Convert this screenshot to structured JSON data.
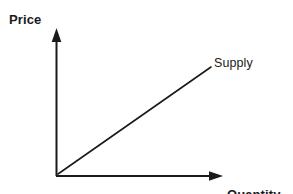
{
  "figure": {
    "kind": "economics-supply-curve-diagram",
    "background_color": "#ffffff",
    "ink_color": "#1a1a1a"
  },
  "labels": {
    "y_axis": "Price",
    "curve": "Supply",
    "x_axis_line1": "Quantity",
    "x_axis_line2": "supplied"
  },
  "chart_data": {
    "type": "line",
    "title": "",
    "subtitle": "",
    "xlabel": "Quantity supplied",
    "ylabel": "Price",
    "grid": false,
    "legend": "none",
    "annotations": [
      {
        "text": "Supply",
        "attached_to": "supply-line",
        "position": "upper-right-of-line-end"
      }
    ],
    "axes": {
      "x": {
        "label": "Quantity supplied",
        "ticks": [],
        "tick_labels": [],
        "arrow": true,
        "range_units": "unlabeled"
      },
      "y": {
        "label": "Price",
        "ticks": [],
        "tick_labels": [],
        "arrow": true,
        "range_units": "unlabeled"
      }
    },
    "series": [
      {
        "name": "Supply",
        "type": "line",
        "style": "straight-upward-sloping",
        "points": [
          {
            "x": 0,
            "y": 0
          },
          {
            "x": 1,
            "y": 1
          }
        ]
      }
    ]
  },
  "geometry": {
    "origin": {
      "x": 56,
      "y": 176
    },
    "y_axis_top": {
      "x": 56,
      "y": 30
    },
    "x_axis_right": {
      "x": 222,
      "y": 176
    },
    "supply_start": {
      "x": 58,
      "y": 174
    },
    "supply_end": {
      "x": 211,
      "y": 67
    },
    "axis_stroke_width": 2,
    "curve_stroke_width": 1.6,
    "arrow_size": 8
  }
}
